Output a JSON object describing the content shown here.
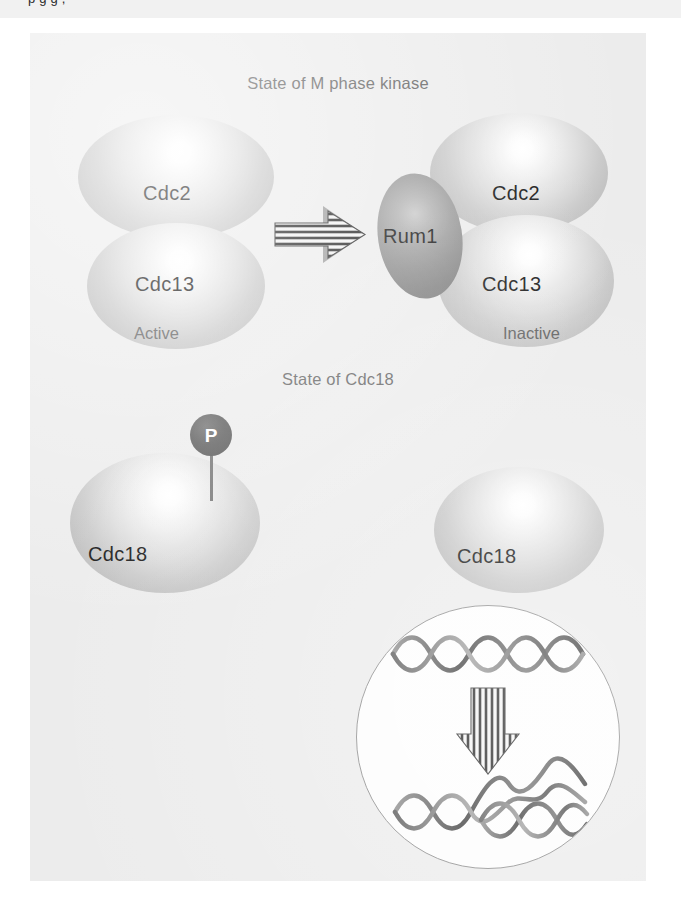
{
  "page": {
    "cropped_caption_fragment": "p    g          g                  ,",
    "background_color": "#ececec"
  },
  "figure": {
    "panel_background": "#ececec",
    "sections": [
      {
        "id": "m-phase-kinase",
        "title": "State of M phase kinase",
        "left_complex": {
          "state_label": "Active",
          "subunits": [
            {
              "name": "Cdc2",
              "shade": "light"
            },
            {
              "name": "Cdc13",
              "shade": "light"
            }
          ]
        },
        "transition_arrow": {
          "direction": "right",
          "style": "striped-block-arrow"
        },
        "right_complex": {
          "state_label": "Inactive",
          "subunits": [
            {
              "name": "Cdc2",
              "shade": "light"
            },
            {
              "name": "Cdc13",
              "shade": "light"
            },
            {
              "name": "Rum1",
              "shade": "dark"
            }
          ]
        }
      },
      {
        "id": "cdc18",
        "title": "State of Cdc18",
        "left_molecule": {
          "name": "Cdc18",
          "shade": "light",
          "modification": {
            "label": "P",
            "type": "phosphate",
            "color": "#525252"
          }
        },
        "right_molecule": {
          "name": "Cdc18",
          "shade": "light",
          "modification": null
        },
        "inset": {
          "type": "dna-replication",
          "parent_strand_turns": 5,
          "daughter_strands": 2,
          "arrow": {
            "direction": "down",
            "style": "striped-block-arrow"
          },
          "border_color": "#8e8e8e",
          "fill_color": "#fdfdfd"
        }
      }
    ]
  }
}
